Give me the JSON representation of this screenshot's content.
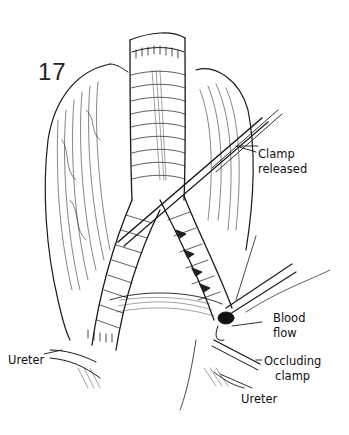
{
  "figure": {
    "number": "17",
    "style": "black-and-white surgical line illustration",
    "colors": {
      "ink": "#111111",
      "background": "#ffffff"
    }
  },
  "labels": {
    "clamp_released": [
      "Clamp",
      "released"
    ],
    "blood_flow": [
      "Blood",
      "flow"
    ],
    "occluding_clamp": [
      "Occluding",
      "clamp"
    ],
    "ureter_right": "Ureter",
    "ureter_left": "Ureter"
  }
}
